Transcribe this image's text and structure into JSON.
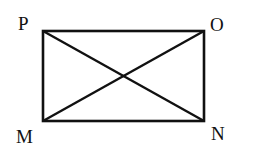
{
  "diagram": {
    "type": "rectangle-with-diagonals",
    "stroke_color": "#111111",
    "background": "#ffffff",
    "vertices": {
      "P": {
        "label": "P",
        "x": 43,
        "y": 31
      },
      "O": {
        "label": "O",
        "x": 204,
        "y": 31
      },
      "M": {
        "label": "M",
        "x": 43,
        "y": 121
      },
      "N": {
        "label": "N",
        "x": 204,
        "y": 121
      }
    },
    "edges": [
      [
        "P",
        "O"
      ],
      [
        "O",
        "N"
      ],
      [
        "N",
        "M"
      ],
      [
        "M",
        "P"
      ]
    ],
    "diagonals": [
      [
        "P",
        "N"
      ],
      [
        "M",
        "O"
      ]
    ]
  }
}
